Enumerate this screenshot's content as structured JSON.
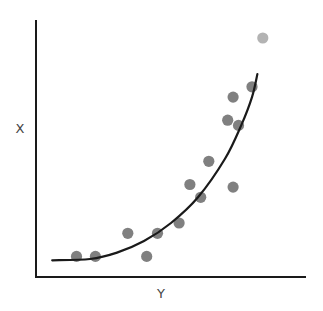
{
  "chart_data": {
    "type": "scatter",
    "title": "",
    "xlabel": "Y",
    "ylabel": "X",
    "grid": false,
    "legend": null,
    "xlim": [
      0,
      10
    ],
    "ylim": [
      0,
      10
    ],
    "points": [
      {
        "x": 1.5,
        "y": 0.8
      },
      {
        "x": 2.2,
        "y": 0.8
      },
      {
        "x": 3.4,
        "y": 1.7
      },
      {
        "x": 4.1,
        "y": 0.8
      },
      {
        "x": 4.5,
        "y": 1.7
      },
      {
        "x": 5.3,
        "y": 2.1
      },
      {
        "x": 5.7,
        "y": 3.6
      },
      {
        "x": 6.1,
        "y": 3.1
      },
      {
        "x": 6.4,
        "y": 4.5
      },
      {
        "x": 7.3,
        "y": 3.5
      },
      {
        "x": 7.1,
        "y": 6.1
      },
      {
        "x": 7.3,
        "y": 7.0
      },
      {
        "x": 7.5,
        "y": 5.9
      },
      {
        "x": 8.0,
        "y": 7.4
      },
      {
        "x": 8.4,
        "y": 9.3,
        "outlier": true
      }
    ],
    "fit_curve": {
      "type": "exponential",
      "description": "Trend line rising steeply to the right",
      "points": [
        {
          "x": 0.6,
          "y": 0.65
        },
        {
          "x": 2.0,
          "y": 0.7
        },
        {
          "x": 3.0,
          "y": 0.95
        },
        {
          "x": 4.0,
          "y": 1.4
        },
        {
          "x": 5.0,
          "y": 2.1
        },
        {
          "x": 6.0,
          "y": 3.1
        },
        {
          "x": 7.0,
          "y": 4.6
        },
        {
          "x": 7.6,
          "y": 5.9
        },
        {
          "x": 8.0,
          "y": 7.0
        },
        {
          "x": 8.2,
          "y": 7.9
        }
      ]
    }
  },
  "colors": {
    "point": "#808080",
    "outlier_point": "#b3b3b3",
    "curve": "#1a1a1a",
    "axis": "#1a1a1a",
    "label": "#444444"
  },
  "labels": {
    "x_axis": "Y",
    "y_axis": "X"
  }
}
